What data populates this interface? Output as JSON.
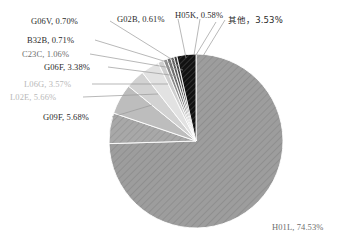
{
  "chart_data": {
    "type": "pie",
    "title": "",
    "subtitle": "",
    "xlabel": "",
    "ylabel": "",
    "grid": false,
    "legend_position": "none",
    "label_format": "{category}, {value}%",
    "start_angle_deg": -90,
    "direction": "clockwise",
    "categories": [
      "H01L",
      "G09F",
      "L02E",
      "L06G",
      "G06F",
      "C23C",
      "B32B",
      "G06V",
      "G02B",
      "H05K",
      "其他"
    ],
    "values": [
      74.53,
      5.68,
      5.66,
      3.57,
      3.38,
      1.06,
      0.71,
      0.7,
      0.61,
      0.58,
      3.53
    ],
    "value_labels": [
      "74.53%",
      "5.68%",
      "5.66%",
      "3.57%",
      "3.38%",
      "1.06%",
      "0.71%",
      "0.70%",
      "0.61%",
      "0.58%",
      "3.53%"
    ],
    "slice_colors": [
      "#9d9d9d",
      "#a8a8a8",
      "#bdbdbd",
      "#d2d2d2",
      "#e2e2e2",
      "#cfcfcf",
      "#8c8c8c",
      "#6f6f6f",
      "#5a5a5a",
      "#3d3d3d",
      "#141414"
    ],
    "slice_hatched": [
      true,
      true,
      false,
      false,
      false,
      false,
      false,
      false,
      false,
      false,
      true
    ],
    "ylim": [
      0,
      100
    ]
  },
  "chart": {
    "center_x": 196,
    "center_y": 141,
    "radius": 87,
    "slices": [
      {
        "key": "h01l",
        "category": "H01L",
        "label": "H01L, 74.53%",
        "value": 74.53,
        "color": "#9d9d9d",
        "label_x": 272,
        "label_y": 222,
        "tone": "mid"
      },
      {
        "key": "g09f",
        "category": "G09F",
        "label": "G09F, 5.68%",
        "value": 5.68,
        "color": "#a8a8a8",
        "label_x": 43,
        "label_y": 112,
        "tone": "dark"
      },
      {
        "key": "l02e",
        "category": "L02E",
        "label": "L02E, 5.66%",
        "value": 5.66,
        "color": "#bdbdbd",
        "label_x": 10,
        "label_y": 92,
        "tone": "faint"
      },
      {
        "key": "l06g",
        "category": "L06G",
        "label": "L06G, 3.57%",
        "value": 3.57,
        "color": "#d2d2d2",
        "label_x": 24,
        "label_y": 79,
        "tone": "faint"
      },
      {
        "key": "g06f",
        "category": "G06F",
        "label": "G06F, 3.38%",
        "value": 3.38,
        "color": "#e2e2e2",
        "label_x": 44,
        "label_y": 62,
        "tone": "dark"
      },
      {
        "key": "c23c",
        "category": "C23C",
        "label": "C23C, 1.06%",
        "value": 1.06,
        "color": "#cfcfcf",
        "label_x": 22,
        "label_y": 49,
        "tone": "mid"
      },
      {
        "key": "b32b",
        "category": "B32B",
        "label": "B32B, 0.71%",
        "value": 0.71,
        "color": "#8c8c8c",
        "label_x": 27,
        "label_y": 35,
        "tone": "dark"
      },
      {
        "key": "g06v",
        "category": "G06V",
        "label": "G06V, 0.70%",
        "value": 0.7,
        "color": "#6f6f6f",
        "label_x": 31,
        "label_y": 16,
        "tone": "dark"
      },
      {
        "key": "g02b",
        "category": "G02B",
        "label": "G02B, 0.61%",
        "value": 0.61,
        "color": "#5a5a5a",
        "label_x": 117,
        "label_y": 14,
        "tone": "dark"
      },
      {
        "key": "h05k",
        "category": "H05K",
        "label": "H05K, 0.58%",
        "value": 0.58,
        "color": "#3d3d3d",
        "label_x": 175,
        "label_y": 10,
        "tone": "dark"
      },
      {
        "key": "others",
        "category": "其他",
        "label": "其他，3.53%",
        "value": 3.53,
        "color": "#141414",
        "label_x": 228,
        "label_y": 15,
        "tone": "dark"
      }
    ],
    "leaders": [
      {
        "key": "g06v",
        "x1": 110,
        "y1": 21,
        "x2": 176,
        "y2": 62
      },
      {
        "key": "b32b",
        "x1": 95,
        "y1": 40,
        "x2": 180,
        "y2": 66
      },
      {
        "key": "c23c",
        "x1": 90,
        "y1": 54,
        "x2": 183,
        "y2": 70
      },
      {
        "key": "g06f",
        "x1": 108,
        "y1": 67,
        "x2": 178,
        "y2": 76
      },
      {
        "key": "l06g",
        "x1": 92,
        "y1": 84,
        "x2": 168,
        "y2": 84
      },
      {
        "key": "l02e",
        "x1": 83,
        "y1": 97,
        "x2": 158,
        "y2": 94
      },
      {
        "key": "g09f",
        "x1": 112,
        "y1": 117,
        "x2": 152,
        "y2": 105
      },
      {
        "key": "g02b",
        "x1": 178,
        "y1": 19,
        "x2": 186,
        "y2": 58
      },
      {
        "key": "h05k",
        "x1": 200,
        "y1": 19,
        "x2": 194,
        "y2": 55
      },
      {
        "key": "h05k2",
        "x1": 216,
        "y1": 22,
        "x2": 196,
        "y2": 55
      },
      {
        "key": "others",
        "x1": 225,
        "y1": 20,
        "x2": 203,
        "y2": 56
      }
    ]
  }
}
